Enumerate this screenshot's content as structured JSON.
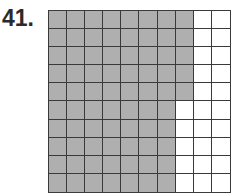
{
  "problem": {
    "number_label": "41."
  },
  "chart_data": {
    "type": "grid",
    "title": "",
    "rows": 10,
    "columns": 10,
    "shaded_per_row": [
      8,
      8,
      8,
      8,
      8,
      7,
      7,
      7,
      7,
      7
    ],
    "total_cells": 100,
    "shaded_cells": 75,
    "unshaded_cells": 25,
    "colors": {
      "shaded": "#b8b8b8",
      "unshaded": "#ffffff",
      "gridline": "#3a3a3a"
    }
  }
}
